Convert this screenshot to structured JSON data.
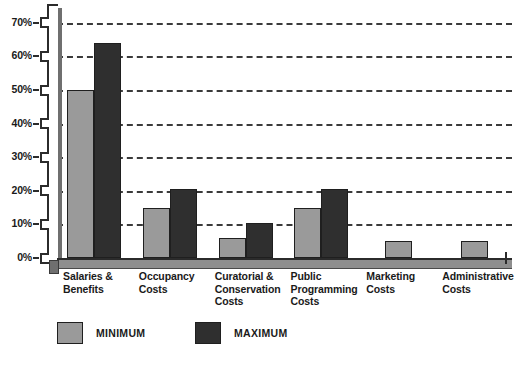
{
  "chart_data": {
    "type": "bar",
    "title": "",
    "subtitle": "",
    "xlabel": "",
    "ylabel": "",
    "ylim": [
      0,
      75
    ],
    "grid": true,
    "grid_style": "dashed-horizontal",
    "legend_position": "bottom",
    "ytick_labels": [
      "70%",
      "60%",
      "50%",
      "40%",
      "30%",
      "20%",
      "10%",
      "0%"
    ],
    "ytick_values": [
      70,
      60,
      50,
      40,
      30,
      20,
      10,
      0
    ],
    "categories": [
      "Salaries & Benefits",
      "Occupancy Costs",
      "Curatorial & Conservation Costs",
      "Public Programming Costs",
      "Marketing Costs",
      "Administrative Costs"
    ],
    "category_lines": [
      [
        "Salaries &",
        "Benefits"
      ],
      [
        "Occupancy",
        "Costs"
      ],
      [
        "Curatorial &",
        "Conservation",
        "Costs"
      ],
      [
        "Public",
        "Programming",
        "Costs"
      ],
      [
        "Marketing",
        "Costs"
      ],
      [
        "Administrative",
        "Costs"
      ]
    ],
    "series": [
      {
        "name": "MINIMUM",
        "color": "#9a9a9a",
        "values": [
          50,
          15,
          6,
          15,
          5,
          5
        ]
      },
      {
        "name": "MAXIMUM",
        "color": "#2f2f2f",
        "values": [
          64,
          20.5,
          10.5,
          20.5,
          5,
          5
        ]
      }
    ]
  },
  "legend": {
    "items": [
      {
        "label": "MINIMUM",
        "swatch": "min"
      },
      {
        "label": "MAXIMUM",
        "swatch": "max"
      }
    ]
  },
  "axis": {
    "y_axis_name": "percent-of-budget-axis"
  }
}
